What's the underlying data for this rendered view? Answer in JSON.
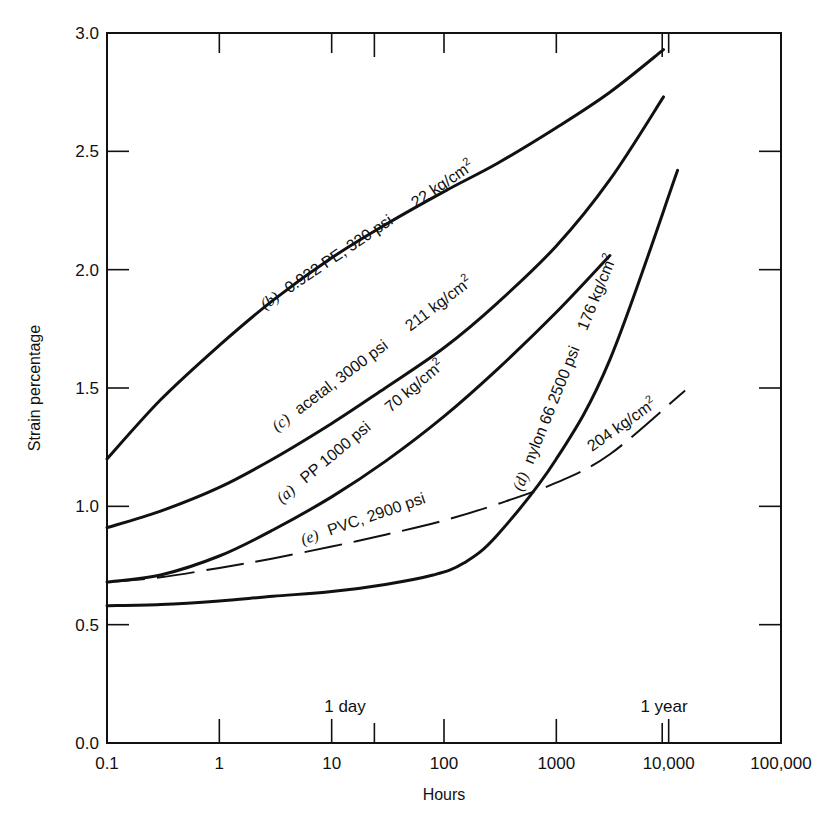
{
  "chart_data": {
    "type": "line",
    "title": "",
    "xlabel": "Hours",
    "ylabel": "Strain percentage",
    "xscale": "log",
    "xlim": [
      0.1,
      100000
    ],
    "ylim": [
      0.0,
      3.0
    ],
    "grid": false,
    "legend": "none (inline curve labels)",
    "x_tick_labels": [
      "0.1",
      "1",
      "10",
      "100",
      "1000",
      "10,000",
      "100,000"
    ],
    "y_tick_labels": [
      "0.0",
      "0.5",
      "1.0",
      "1.5",
      "2.0",
      "2.5",
      "3.0"
    ],
    "annotations": [
      {
        "text": "1 day",
        "x": 24
      },
      {
        "text": "1 year",
        "x": 8760
      }
    ],
    "series": [
      {
        "id": "b",
        "name": "(b) 0.922 PE, 320 psi 22 kg/cm2",
        "style": "solid",
        "x": [
          0.1,
          0.3,
          1,
          3,
          10,
          30,
          100,
          300,
          1000,
          3000,
          9000
        ],
        "y": [
          1.2,
          1.45,
          1.68,
          1.87,
          2.05,
          2.19,
          2.33,
          2.45,
          2.6,
          2.75,
          2.93
        ]
      },
      {
        "id": "c",
        "name": "(c) acetal, 3000 psi 211 kg/cm2",
        "style": "solid",
        "x": [
          0.1,
          0.3,
          1,
          3,
          10,
          30,
          100,
          300,
          1000,
          3000,
          9000
        ],
        "y": [
          0.91,
          0.98,
          1.08,
          1.2,
          1.35,
          1.5,
          1.67,
          1.86,
          2.1,
          2.38,
          2.73
        ]
      },
      {
        "id": "a",
        "name": "(a) PP 1000 psi 70 kg/cm2",
        "style": "solid",
        "x": [
          0.1,
          0.3,
          1,
          3,
          10,
          30,
          100,
          300,
          1000,
          3000
        ],
        "y": [
          0.68,
          0.71,
          0.79,
          0.9,
          1.04,
          1.19,
          1.38,
          1.58,
          1.82,
          2.06
        ]
      },
      {
        "id": "e",
        "name": "(e) PVC, 2900 psi 204 kg/cm2",
        "style": "dashed",
        "x": [
          0.1,
          0.3,
          1,
          3,
          10,
          30,
          100,
          300,
          1000,
          3000,
          14000
        ],
        "y": [
          0.68,
          0.7,
          0.74,
          0.78,
          0.83,
          0.88,
          0.94,
          1.01,
          1.1,
          1.22,
          1.49
        ]
      },
      {
        "id": "d",
        "name": "(d) nylon 66 2500 psi 176 kg/cm2",
        "style": "solid",
        "x": [
          0.1,
          0.3,
          1,
          3,
          10,
          30,
          80,
          150,
          300,
          1000,
          3000,
          12000
        ],
        "y": [
          0.58,
          0.585,
          0.6,
          0.62,
          0.64,
          0.67,
          0.71,
          0.76,
          0.88,
          1.2,
          1.62,
          2.42
        ]
      }
    ]
  },
  "labels": {
    "b": {
      "tag": "(b)",
      "text": "0.922 PE, 320 psi",
      "metric": "22 kg/cm",
      "sup": "2"
    },
    "c": {
      "tag": "(c)",
      "text": "acetal, 3000 psi",
      "metric": "211 kg/cm",
      "sup": "2"
    },
    "a": {
      "tag": "(a)",
      "text": "PP 1000 psi",
      "metric": "70 kg/cm",
      "sup": "2"
    },
    "e": {
      "tag": "(e)",
      "text": "PVC, 2900 psi",
      "metric": "204 kg/cm",
      "sup": "2"
    },
    "d": {
      "tag": "(d)",
      "text": "nylon 66 2500 psi",
      "metric": "176 kg/cm",
      "sup": "2"
    }
  }
}
